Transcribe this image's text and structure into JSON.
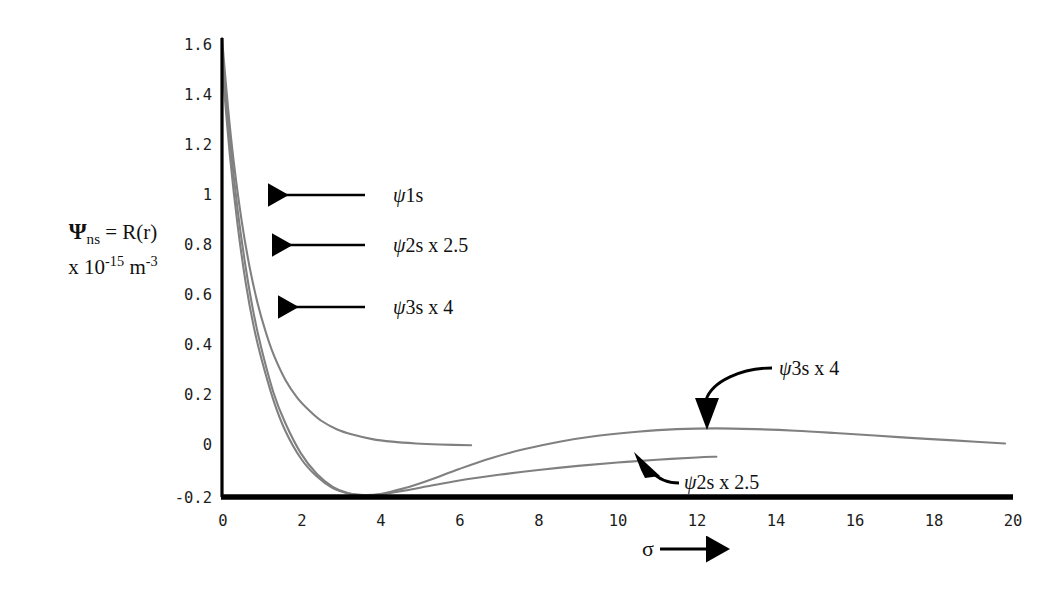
{
  "figure": {
    "name": "radial-wavefunction-plot",
    "background": "#ffffff",
    "curve_color": "#808080",
    "axis_color": "#000000",
    "text_color": "#111111"
  },
  "axis_label": {
    "line1_psi": "Ψ",
    "line1_sub": "ns",
    "line1_rest": " = R(r)",
    "line2_prefix": "x 10",
    "line2_exp1": "-15",
    "line2_unit": " m",
    "line2_exp2": "-3",
    "full_text": "Ψns = R(r) x 10-15 m-3"
  },
  "x_axis": {
    "label": "σ",
    "label_arrow": "arrow-right",
    "ticks": [
      "0",
      "2",
      "4",
      "6",
      "8",
      "10",
      "12",
      "14",
      "16",
      "18",
      "20"
    ]
  },
  "y_axis": {
    "ticks": [
      "1.6",
      "1.4",
      "1.2",
      "1",
      "0.8",
      "0.6",
      "0.4",
      "0.2",
      "0",
      "-0.2"
    ]
  },
  "annotations": [
    {
      "id": "psi1s-left",
      "psi": "ψ",
      "text": "1s",
      "arrow": "arrow-left"
    },
    {
      "id": "psi2s-left",
      "psi": "ψ",
      "text": "2s x 2.5",
      "arrow": "arrow-left"
    },
    {
      "id": "psi3s-left",
      "psi": "ψ",
      "text": "3s x 4",
      "arrow": "arrow-left"
    },
    {
      "id": "psi3s-right",
      "psi": "ψ",
      "text": "3s x 4",
      "arrow": "curved-arrow-down"
    },
    {
      "id": "psi2s-right",
      "psi": "ψ",
      "text": "2s x 2.5",
      "arrow": "curved-arrow-upleft"
    }
  ],
  "chart_data": {
    "type": "line",
    "title": "",
    "xlabel": "σ",
    "ylabel": "Ψns = R(r) x 10-15 m-3",
    "xlim": [
      0,
      20
    ],
    "ylim": [
      -0.2,
      1.6
    ],
    "xticks": [
      0,
      2,
      4,
      6,
      8,
      10,
      12,
      14,
      16,
      18,
      20
    ],
    "yticks": [
      -0.2,
      0,
      0.2,
      0.4,
      0.6,
      0.8,
      1.0,
      1.2,
      1.4,
      1.6
    ],
    "grid": false,
    "legend": "annotated-inline",
    "series": [
      {
        "name": "ψ1s",
        "color": "#808080",
        "x": [
          0,
          0.15,
          0.3,
          0.5,
          0.7,
          0.9,
          1.1,
          1.3,
          1.6,
          1.9,
          2.2,
          2.5,
          2.9,
          3.3,
          3.8,
          4.3,
          4.9,
          5.5,
          6.3
        ],
        "y": [
          1.6,
          1.33,
          1.11,
          0.88,
          0.7,
          0.56,
          0.45,
          0.36,
          0.26,
          0.19,
          0.14,
          0.1,
          0.066,
          0.045,
          0.027,
          0.017,
          0.01,
          0.006,
          0.003
        ]
      },
      {
        "name": "ψ2s x 2.5",
        "color": "#808080",
        "x": [
          0,
          0.2,
          0.4,
          0.6,
          0.8,
          1.0,
          1.3,
          1.6,
          2.0,
          2.4,
          2.8,
          3.2,
          3.6,
          4.0,
          4.6,
          5.2,
          6.0,
          7.0,
          8.0,
          9.0,
          10.0,
          11.0,
          12.0,
          12.5
        ],
        "y": [
          1.55,
          1.2,
          0.92,
          0.7,
          0.52,
          0.38,
          0.21,
          0.09,
          -0.03,
          -0.11,
          -0.16,
          -0.185,
          -0.193,
          -0.19,
          -0.175,
          -0.158,
          -0.135,
          -0.113,
          -0.094,
          -0.078,
          -0.065,
          -0.054,
          -0.045,
          -0.042
        ]
      },
      {
        "name": "ψ3s x 4",
        "color": "#808080",
        "x": [
          0,
          0.2,
          0.4,
          0.6,
          0.8,
          1.0,
          1.3,
          1.6,
          2.0,
          2.4,
          2.8,
          3.2,
          3.6,
          4.0,
          4.6,
          5.2,
          6.0,
          6.8,
          7.6,
          8.5,
          9.5,
          10.5,
          11.5,
          12.5,
          13.5,
          14.5,
          15.5,
          16.5,
          17.5,
          18.5,
          19.8
        ],
        "y": [
          1.5,
          1.14,
          0.86,
          0.64,
          0.47,
          0.34,
          0.18,
          0.06,
          -0.05,
          -0.12,
          -0.165,
          -0.186,
          -0.192,
          -0.188,
          -0.166,
          -0.136,
          -0.09,
          -0.048,
          -0.014,
          0.016,
          0.04,
          0.056,
          0.066,
          0.069,
          0.066,
          0.06,
          0.051,
          0.041,
          0.031,
          0.022,
          0.01
        ]
      }
    ]
  }
}
